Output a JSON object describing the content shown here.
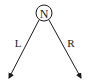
{
  "diagram": {
    "root": {
      "label": "N"
    },
    "edges": [
      {
        "label": "L",
        "direction": "left"
      },
      {
        "label": "R",
        "direction": "right"
      }
    ],
    "colors": {
      "stroke": "#1a1a1a",
      "background": "#ffffff"
    }
  }
}
